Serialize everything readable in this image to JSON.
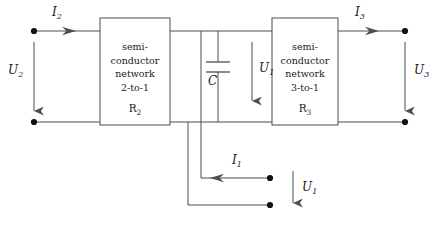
{
  "diagram": {
    "stroke_color": "#4d4d4d",
    "text_color": "#1a1a1a",
    "blocks": [
      {
        "id": "left-block",
        "lines": [
          "semi-",
          "conductor",
          "network",
          "2-to-1"
        ],
        "resistor": "R",
        "resistor_sub": "2"
      },
      {
        "id": "right-block",
        "lines": [
          "semi-",
          "conductor",
          "network",
          "3-to-1"
        ],
        "resistor": "R",
        "resistor_sub": "3"
      }
    ],
    "labels": {
      "i2": "I",
      "i2_sub": "2",
      "u2": "U",
      "u2_sub": "2",
      "i3": "I",
      "i3_sub": "3",
      "u3": "U",
      "u3_sub": "3",
      "i1": "I",
      "i1_sub": "1",
      "u1_inner": "U",
      "u1_inner_sub": "1",
      "u1_outer": "U",
      "u1_outer_sub": "1",
      "capacitor": "C"
    }
  }
}
